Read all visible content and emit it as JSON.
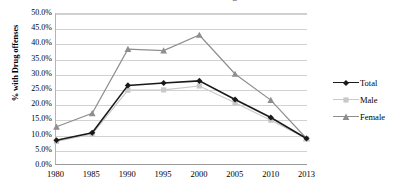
{
  "title_sliver": "Percent of Sentenced Prisoners with Drug Offenses",
  "chart_data": {
    "type": "line",
    "title": "",
    "xlabel": "",
    "ylabel": "% with Drug offenses",
    "categories": [
      "1980",
      "1985",
      "1990",
      "1995",
      "2000",
      "2005",
      "2010",
      "2013"
    ],
    "ylim": [
      0,
      50
    ],
    "ytick_values": [
      0,
      5,
      10,
      15,
      20,
      25,
      30,
      35,
      40,
      45,
      50
    ],
    "ytick_labels": [
      "0.0%",
      "5.0%",
      "10.0%",
      "15.0%",
      "20.0%",
      "25.0%",
      "30.0%",
      "35.0%",
      "40.0%",
      "45.0%",
      "50.0%"
    ],
    "grid": true,
    "legend_position": "right",
    "series": [
      {
        "name": "Total",
        "color": "#1a1a1a",
        "marker": "diamond",
        "values": [
          7.9,
          10.4,
          26.2,
          27.0,
          27.7,
          21.5,
          15.5,
          8.5
        ]
      },
      {
        "name": "Male",
        "color": "#c9c9c9",
        "marker": "square",
        "values": [
          7.5,
          10.0,
          24.6,
          24.7,
          26.0,
          20.4,
          14.6,
          8.5
        ]
      },
      {
        "name": "Female",
        "color": "#8e8e8e",
        "marker": "triangle",
        "values": [
          12.4,
          16.9,
          38.3,
          37.8,
          43.0,
          30.0,
          21.3,
          8.5
        ]
      }
    ]
  },
  "legend": {
    "items": [
      {
        "label": "Total"
      },
      {
        "label": "Male"
      },
      {
        "label": "Female"
      }
    ]
  }
}
